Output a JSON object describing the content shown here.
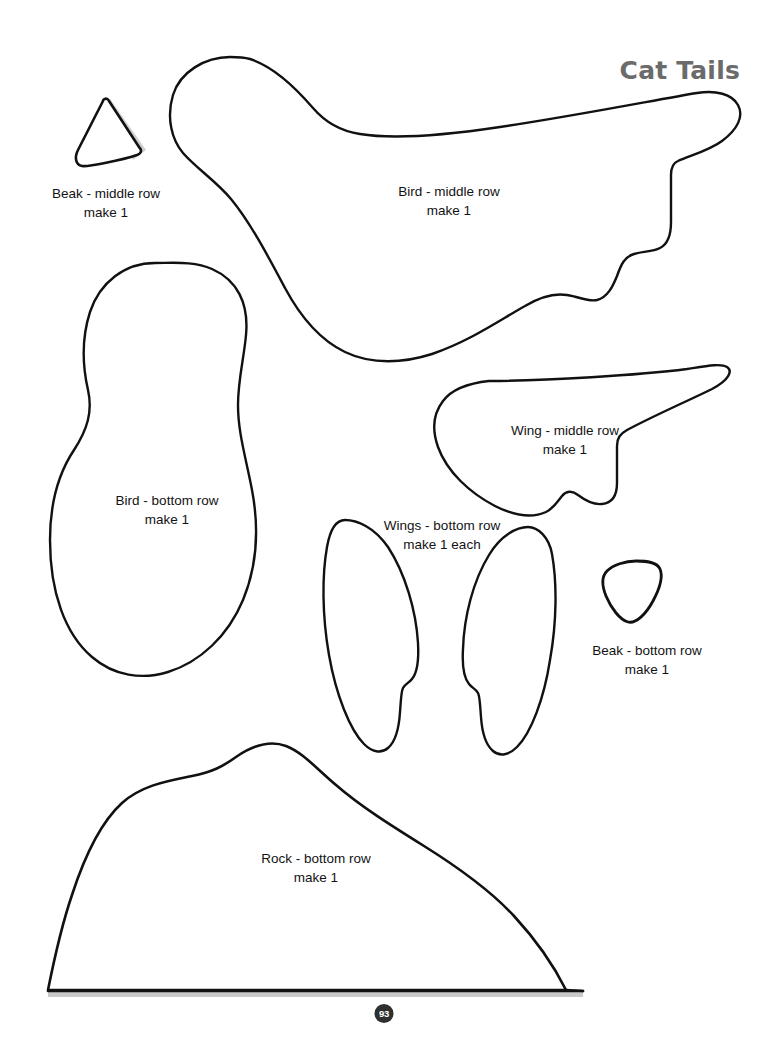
{
  "page": {
    "title": "Cat Tails",
    "title_color": "#6b6b6b",
    "number": "93",
    "background_color": "#ffffff",
    "outline_color": "#111111",
    "shadow_color": "#c8c8c8",
    "width": 768,
    "height": 1037
  },
  "pieces": [
    {
      "id": "beak-middle",
      "name": "Beak - middle row",
      "quantity_label": "make 1",
      "shape": "triangle-with-shadow",
      "has_shadow": true
    },
    {
      "id": "bird-middle",
      "name": "Bird - middle row",
      "quantity_label": "make 1",
      "shape": "bird-body-with-tail",
      "has_shadow": false
    },
    {
      "id": "bird-bottom",
      "name": "Bird - bottom row",
      "quantity_label": "make 1",
      "shape": "peanut-pear",
      "has_shadow": false
    },
    {
      "id": "wing-middle",
      "name": "Wing - middle row",
      "quantity_label": "make 1",
      "shape": "wing-notched",
      "has_shadow": false
    },
    {
      "id": "wings-bottom",
      "name": "Wings - bottom row",
      "quantity_label": "make 1 each",
      "shape": "mirrored-petal-pair",
      "has_shadow": false
    },
    {
      "id": "beak-bottom",
      "name": "Beak - bottom row",
      "quantity_label": "make 1",
      "shape": "rounded-triangle",
      "has_shadow": false
    },
    {
      "id": "rock-bottom",
      "name": "Rock - bottom row",
      "quantity_label": "make 1",
      "shape": "rock-mound",
      "has_shadow": true
    }
  ]
}
